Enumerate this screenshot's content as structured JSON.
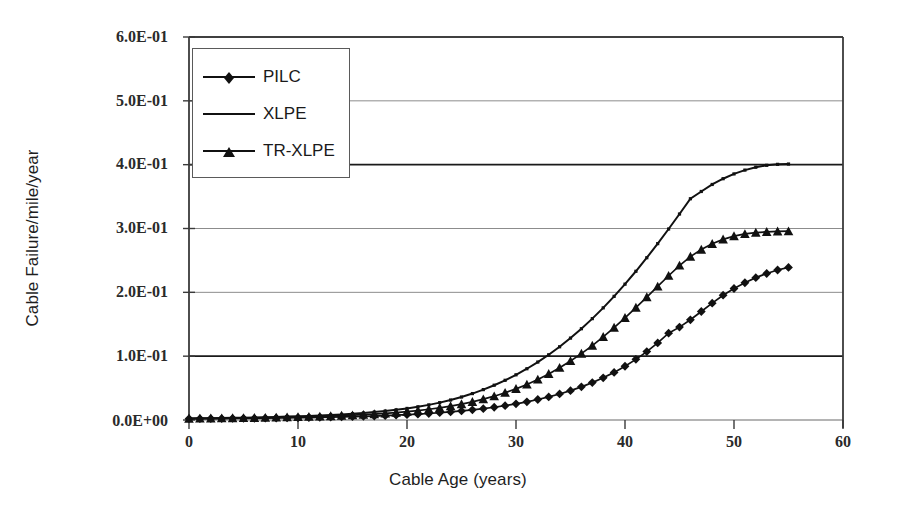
{
  "chart_data": {
    "type": "line",
    "title": "",
    "xlabel": "Cable Age (years)",
    "ylabel": "Cable Failure/mile/year",
    "xlim": [
      0,
      60
    ],
    "ylim": [
      0,
      0.6
    ],
    "xticks": [
      0,
      10,
      20,
      30,
      40,
      50,
      60
    ],
    "xtick_labels": [
      "0",
      "10",
      "20",
      "30",
      "40",
      "50",
      "60"
    ],
    "yticks": [
      0.0,
      0.1,
      0.2,
      0.3,
      0.4,
      0.5,
      0.6
    ],
    "ytick_labels": [
      "0.0E+00",
      "1.0E-01",
      "2.0E-01",
      "3.0E-01",
      "4.0E-01",
      "5.0E-01",
      "6.0E-01"
    ],
    "grid": "horizontal",
    "legend_position": "upper-left-inside",
    "x": [
      0,
      1,
      2,
      3,
      4,
      5,
      6,
      7,
      8,
      9,
      10,
      11,
      12,
      13,
      14,
      15,
      16,
      17,
      18,
      19,
      20,
      21,
      22,
      23,
      24,
      25,
      26,
      27,
      28,
      29,
      30,
      31,
      32,
      33,
      34,
      35,
      36,
      37,
      38,
      39,
      40,
      41,
      42,
      43,
      44,
      45,
      46,
      47,
      48,
      49,
      50,
      51,
      52,
      53,
      54,
      55
    ],
    "series": [
      {
        "name": "PILC",
        "marker": "diamond",
        "color": "#111111",
        "values": [
          0.002,
          0.0021,
          0.0022,
          0.0023,
          0.0024,
          0.0026,
          0.0027,
          0.0029,
          0.0031,
          0.0033,
          0.0035,
          0.0038,
          0.0041,
          0.0044,
          0.0048,
          0.0052,
          0.0057,
          0.0062,
          0.0068,
          0.0075,
          0.0083,
          0.0092,
          0.0102,
          0.0114,
          0.0127,
          0.0142,
          0.0159,
          0.0178,
          0.02,
          0.0225,
          0.0253,
          0.0285,
          0.0321,
          0.0362,
          0.0408,
          0.046,
          0.0519,
          0.0586,
          0.0661,
          0.0746,
          0.0842,
          0.095,
          0.1072,
          0.1208,
          0.136,
          0.1455,
          0.157,
          0.17,
          0.183,
          0.1955,
          0.206,
          0.215,
          0.223,
          0.2295,
          0.235,
          0.239
        ]
      },
      {
        "name": "XLPE",
        "marker": "line",
        "color": "#111111",
        "values": [
          0.0025,
          0.0027,
          0.0029,
          0.0031,
          0.0034,
          0.0037,
          0.004,
          0.0044,
          0.0048,
          0.0053,
          0.0058,
          0.0064,
          0.0071,
          0.0079,
          0.0088,
          0.0098,
          0.011,
          0.0124,
          0.014,
          0.0159,
          0.0181,
          0.0207,
          0.0237,
          0.0272,
          0.0313,
          0.036,
          0.0414,
          0.0476,
          0.0545,
          0.0622,
          0.0708,
          0.0803,
          0.0908,
          0.1022,
          0.1147,
          0.1283,
          0.143,
          0.1588,
          0.1757,
          0.1937,
          0.2128,
          0.233,
          0.2542,
          0.2763,
          0.2992,
          0.3227,
          0.3466,
          0.358,
          0.369,
          0.378,
          0.3855,
          0.3915,
          0.396,
          0.399,
          0.4005,
          0.401
        ]
      },
      {
        "name": "TR-XLPE",
        "marker": "triangle",
        "color": "#111111",
        "values": [
          0.0022,
          0.0024,
          0.0025,
          0.0027,
          0.0029,
          0.0031,
          0.0034,
          0.0036,
          0.0039,
          0.0043,
          0.0047,
          0.0051,
          0.0056,
          0.0061,
          0.0068,
          0.0075,
          0.0083,
          0.0092,
          0.0103,
          0.0116,
          0.0131,
          0.0148,
          0.0168,
          0.0191,
          0.0218,
          0.0249,
          0.0285,
          0.0326,
          0.0373,
          0.0427,
          0.0488,
          0.0557,
          0.0635,
          0.0722,
          0.0818,
          0.0924,
          0.104,
          0.1166,
          0.1302,
          0.1447,
          0.16,
          0.176,
          0.1925,
          0.2092,
          0.226,
          0.242,
          0.256,
          0.267,
          0.276,
          0.283,
          0.288,
          0.2915,
          0.2935,
          0.2948,
          0.2955,
          0.2958
        ]
      }
    ]
  },
  "legend": {
    "items": [
      {
        "label": "PILC",
        "marker": "diamond"
      },
      {
        "label": "XLPE",
        "marker": "line"
      },
      {
        "label": "TR-XLPE",
        "marker": "triangle"
      }
    ]
  },
  "colors": {
    "series_line": "#111111",
    "axis_line": "#4a4a4a",
    "gridline_minor": "#8c8c8c",
    "gridline_major": "#1a1a1a",
    "background": "#ffffff",
    "text": "#1a1a1a"
  }
}
